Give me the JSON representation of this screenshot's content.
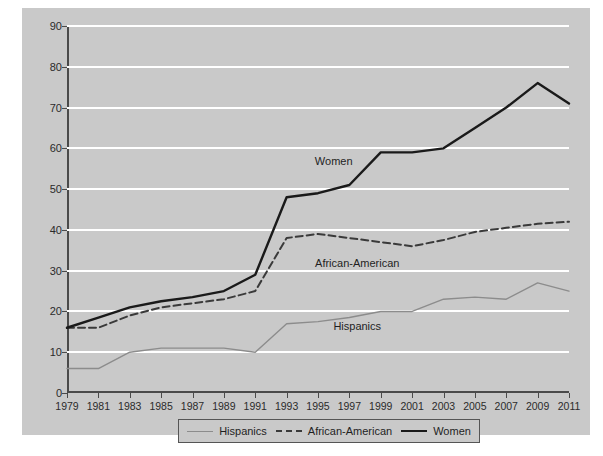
{
  "chart_data": {
    "type": "line",
    "title": "",
    "xlabel": "",
    "ylabel": "",
    "x": [
      1979,
      1981,
      1983,
      1985,
      1987,
      1989,
      1991,
      1993,
      1995,
      1997,
      1999,
      2001,
      2003,
      2005,
      2007,
      2009,
      2011
    ],
    "xlim": [
      1979,
      2011
    ],
    "ylim": [
      0,
      90
    ],
    "yticks": [
      0,
      10,
      20,
      30,
      40,
      50,
      60,
      70,
      80,
      90
    ],
    "xticks": [
      "1979",
      "1981",
      "1983",
      "1985",
      "1987",
      "1989",
      "1991",
      "1993",
      "1995",
      "1997",
      "1999",
      "2001",
      "2003",
      "2005",
      "2007",
      "2009",
      "2011"
    ],
    "grid": "horizontal",
    "legend_position": "bottom",
    "series": [
      {
        "name": "Hispanics",
        "style": "solid-thin",
        "color": "#8c8c8c",
        "values": [
          6,
          6,
          10,
          11,
          11,
          11,
          10,
          17,
          17.5,
          18.5,
          20,
          20,
          23,
          23.5,
          23,
          27,
          25
        ]
      },
      {
        "name": "African-American",
        "style": "dashed",
        "color": "#3a3a3a",
        "values": [
          16,
          16,
          19,
          21,
          22,
          23,
          25,
          38,
          39,
          38,
          37,
          36,
          37.5,
          39.5,
          40.5,
          41.5,
          42
        ]
      },
      {
        "name": "Women",
        "style": "solid-thick",
        "color": "#1a1a1a",
        "values": [
          16,
          18.5,
          21,
          22.5,
          23.5,
          25,
          29,
          48,
          49,
          51,
          59,
          59,
          60,
          65,
          70,
          76,
          71
        ]
      }
    ],
    "annotations": [
      {
        "text": "Women",
        "x": 1996,
        "y": 57
      },
      {
        "text": "African-American",
        "x": 1997.5,
        "y": 32
      },
      {
        "text": "Hispanics",
        "x": 1997.5,
        "y": 16.5
      }
    ]
  },
  "legend": {
    "items": [
      {
        "label": "Hispanics"
      },
      {
        "label": "African-American"
      },
      {
        "label": "Women"
      }
    ]
  },
  "colors": {
    "figure_background": "#c9c9c9",
    "page_background": "#ffffff",
    "gridline": "#ffffff",
    "axis": "#4a4a4a"
  }
}
